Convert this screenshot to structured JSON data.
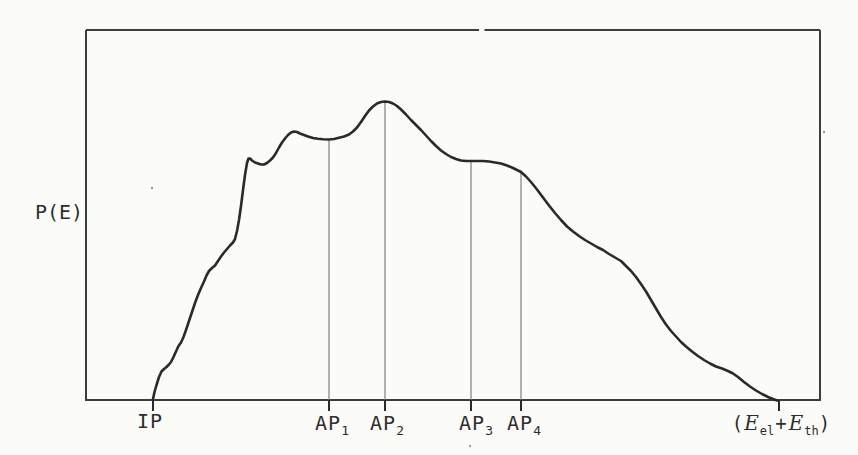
{
  "figure": {
    "ylabel": "P(E)",
    "ylabel_pos": {
      "x_px": 59,
      "y_px": 202
    },
    "paper_color": "#fbfbf8",
    "ink_color": "#2a2a2a",
    "frame_color": "#3d3d3d",
    "guide_color": "#757575",
    "speck_color": "#a0a0a0"
  },
  "frame": {
    "left": 86,
    "top": 30,
    "right": 820,
    "bottom": 400,
    "top_gap": [
      479,
      484.5
    ]
  },
  "xaxis": {
    "ip": {
      "label": "IP",
      "x_px": 150,
      "y_px": 411
    },
    "ap": [
      {
        "base": "AP",
        "sub": "1",
        "x_px": 332,
        "y_px": 413
      },
      {
        "base": "AP",
        "sub": "2",
        "x_px": 387,
        "y_px": 413
      },
      {
        "base": "AP",
        "sub": "3",
        "x_px": 476,
        "y_px": 413
      },
      {
        "base": "AP",
        "sub": "4",
        "x_px": 524,
        "y_px": 413
      }
    ],
    "emax": {
      "open": "(",
      "e1": "E",
      "sub1": "el",
      "plus": "+",
      "e2": "E",
      "sub2": "th",
      "close": ")",
      "x_px": 781,
      "y_px": 413
    }
  },
  "chart_data": {
    "type": "line",
    "title": "",
    "xlabel": "",
    "ylabel": "P(E)",
    "grid": false,
    "legend_position": "none",
    "axis_style": "closed box, no numeric ticks, qualitative energy axis",
    "x_markers": [
      {
        "label": "IP",
        "x_px": 153,
        "x_frac": 0.091
      },
      {
        "label": "AP1",
        "x_px": 329,
        "x_frac": 0.331
      },
      {
        "label": "AP2",
        "x_px": 385,
        "x_frac": 0.407
      },
      {
        "label": "AP3",
        "x_px": 471,
        "x_frac": 0.525
      },
      {
        "label": "AP4",
        "x_px": 521,
        "x_frac": 0.593
      },
      {
        "label": "(Eel+Eth)",
        "x_px": 779,
        "x_frac": 0.944
      }
    ],
    "verticals": [
      {
        "marker": "AP1",
        "x": 329,
        "y_top": 140,
        "p_rel": 0.874
      },
      {
        "marker": "AP2",
        "x": 385,
        "y_top": 101.5,
        "p_rel": 1.0
      },
      {
        "marker": "AP3",
        "x": 471,
        "y_top": 161,
        "p_rel": 0.801
      },
      {
        "marker": "AP4",
        "x": 521,
        "y_top": 172,
        "p_rel": 0.764
      }
    ],
    "baseline_y": 400,
    "tick_len": 11,
    "ticks_below_axis_x": [
      153,
      329,
      385,
      471,
      521,
      779
    ],
    "curve_px": [
      [
        153,
        399
      ],
      [
        154.5,
        392
      ],
      [
        156.5,
        385
      ],
      [
        159,
        377
      ],
      [
        161.5,
        371.5
      ],
      [
        164,
        369
      ],
      [
        166.5,
        367
      ],
      [
        169,
        364.5
      ],
      [
        171,
        362
      ],
      [
        173.5,
        357
      ],
      [
        176,
        351.5
      ],
      [
        178.5,
        346
      ],
      [
        181,
        342.5
      ],
      [
        183.5,
        337
      ],
      [
        186,
        330
      ],
      [
        189,
        321
      ],
      [
        192,
        312
      ],
      [
        195,
        303
      ],
      [
        198,
        295
      ],
      [
        201,
        288
      ],
      [
        204,
        281.5
      ],
      [
        206.5,
        275.5
      ],
      [
        209,
        271
      ],
      [
        212,
        268
      ],
      [
        215,
        265.5
      ],
      [
        218,
        261
      ],
      [
        221,
        256.5
      ],
      [
        224,
        252.5
      ],
      [
        227,
        249
      ],
      [
        230,
        245.5
      ],
      [
        233,
        242.5
      ],
      [
        235,
        239
      ],
      [
        237,
        231
      ],
      [
        239,
        220
      ],
      [
        241,
        206
      ],
      [
        243,
        190
      ],
      [
        245,
        175
      ],
      [
        247,
        163
      ],
      [
        248.5,
        158.5
      ],
      [
        250,
        158.5
      ],
      [
        252,
        160.5
      ],
      [
        255,
        162.5
      ],
      [
        258,
        163.5
      ],
      [
        261,
        164.5
      ],
      [
        264,
        164.5
      ],
      [
        267,
        163
      ],
      [
        270,
        160.5
      ],
      [
        273,
        157.5
      ],
      [
        276,
        153
      ],
      [
        279,
        147.5
      ],
      [
        282,
        142.5
      ],
      [
        285,
        138.5
      ],
      [
        288,
        135
      ],
      [
        291,
        132.5
      ],
      [
        294,
        131.5
      ],
      [
        297,
        132
      ],
      [
        300,
        133.5
      ],
      [
        304,
        135
      ],
      [
        308,
        136.5
      ],
      [
        313,
        138
      ],
      [
        318,
        138.8
      ],
      [
        323,
        139.2
      ],
      [
        329,
        139.5
      ],
      [
        334,
        139
      ],
      [
        339,
        137.8
      ],
      [
        344,
        136.5
      ],
      [
        349,
        134.5
      ],
      [
        353,
        131.5
      ],
      [
        357,
        127.5
      ],
      [
        361,
        122
      ],
      [
        365,
        116
      ],
      [
        369,
        110.5
      ],
      [
        373,
        106.5
      ],
      [
        377,
        103.5
      ],
      [
        381,
        102
      ],
      [
        385,
        101.5
      ],
      [
        389,
        102
      ],
      [
        393,
        103.5
      ],
      [
        397,
        106
      ],
      [
        401,
        109.5
      ],
      [
        406,
        114.5
      ],
      [
        411,
        120
      ],
      [
        416,
        125
      ],
      [
        421,
        130
      ],
      [
        426,
        135.5
      ],
      [
        431,
        141
      ],
      [
        436,
        146
      ],
      [
        441,
        150.5
      ],
      [
        446,
        154
      ],
      [
        451,
        157
      ],
      [
        456,
        159
      ],
      [
        461,
        160.5
      ],
      [
        466,
        161
      ],
      [
        471,
        161
      ],
      [
        477,
        161
      ],
      [
        483,
        161
      ],
      [
        489,
        161.5
      ],
      [
        495,
        162.5
      ],
      [
        501,
        163.5
      ],
      [
        507,
        165.5
      ],
      [
        513,
        168
      ],
      [
        518,
        170.5
      ],
      [
        521,
        172
      ],
      [
        526,
        176.5
      ],
      [
        531,
        182
      ],
      [
        537,
        189.5
      ],
      [
        543,
        197.5
      ],
      [
        549,
        205.5
      ],
      [
        555,
        213
      ],
      [
        561,
        220
      ],
      [
        567,
        226.5
      ],
      [
        573,
        231.5
      ],
      [
        579,
        236
      ],
      [
        585,
        240
      ],
      [
        591,
        243.5
      ],
      [
        597,
        247
      ],
      [
        603,
        250
      ],
      [
        609,
        254
      ],
      [
        615,
        257.5
      ],
      [
        621,
        261
      ],
      [
        626,
        266
      ],
      [
        631,
        271
      ],
      [
        636,
        277
      ],
      [
        641,
        284
      ],
      [
        646,
        291.5
      ],
      [
        651,
        300
      ],
      [
        656,
        308.5
      ],
      [
        661,
        317
      ],
      [
        666,
        324.5
      ],
      [
        671,
        331
      ],
      [
        676,
        336.5
      ],
      [
        681,
        342
      ],
      [
        686,
        346.5
      ],
      [
        692,
        351.5
      ],
      [
        698,
        356
      ],
      [
        704,
        360
      ],
      [
        710,
        363.5
      ],
      [
        716,
        366.5
      ],
      [
        722,
        368.5
      ],
      [
        728,
        371
      ],
      [
        733,
        373.5
      ],
      [
        738,
        377
      ],
      [
        744,
        382
      ],
      [
        750,
        386.5
      ],
      [
        756,
        390.5
      ],
      [
        762,
        394
      ],
      [
        768,
        397
      ],
      [
        773,
        399
      ],
      [
        777,
        400.5
      ]
    ],
    "specks": [
      [
        152,
        188
      ],
      [
        470,
        446
      ],
      [
        824,
        132
      ]
    ]
  }
}
